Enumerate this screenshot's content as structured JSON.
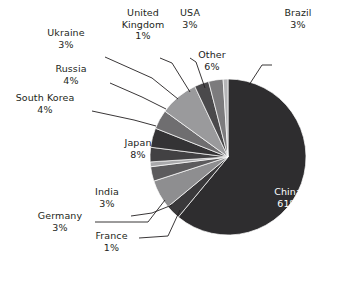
{
  "chart_data": {
    "type": "pie",
    "title": "",
    "subtitle": "",
    "xlabel": "",
    "ylabel": "",
    "legend_position": "none",
    "grid": false,
    "value_unit": "percent",
    "categories": [
      "China",
      "Brazil",
      "Other",
      "USA",
      "United Kingdom",
      "Ukraine",
      "Russia",
      "South Korea",
      "Japan",
      "India",
      "Germany",
      "France"
    ],
    "values": [
      61,
      3,
      6,
      3,
      1,
      3,
      4,
      4,
      8,
      3,
      3,
      1
    ],
    "labels": [
      "61%",
      "3%",
      "6%",
      "3%",
      "1%",
      "3%",
      "4%",
      "4%",
      "8%",
      "3%",
      "3%",
      "1%"
    ],
    "colors": [
      "#2e2d2f",
      "#3a393b",
      "#8e8e90",
      "#5c5b5d",
      "#a9a9ab",
      "#424143",
      "#343335",
      "#6f6e70",
      "#9a9a9c",
      "#4a494b",
      "#7c7b7d",
      "#b5b5b7"
    ],
    "slices": [
      {
        "name": "China",
        "percent": 61,
        "label": "China",
        "value_label": "61%",
        "color": "#2e2d2f",
        "label_placement": "inside",
        "text_color": "#ffffff"
      },
      {
        "name": "Brazil",
        "percent": 3,
        "label": "Brazil",
        "value_label": "3%",
        "color": "#3a393b",
        "label_placement": "outside",
        "text_color": "#231f20"
      },
      {
        "name": "Other",
        "percent": 6,
        "label": "Other",
        "value_label": "6%",
        "color": "#8e8e90",
        "label_placement": "inside",
        "text_color": "#1a1a1a"
      },
      {
        "name": "USA",
        "percent": 3,
        "label": "USA",
        "value_label": "3%",
        "color": "#5c5b5d",
        "label_placement": "outside",
        "text_color": "#231f20"
      },
      {
        "name": "United Kingdom",
        "percent": 1,
        "label": "United Kingdom",
        "value_label": "1%",
        "color": "#a9a9ab",
        "label_placement": "outside",
        "text_color": "#231f20"
      },
      {
        "name": "Ukraine",
        "percent": 3,
        "label": "Ukraine",
        "value_label": "3%",
        "color": "#424143",
        "label_placement": "outside",
        "text_color": "#231f20"
      },
      {
        "name": "Russia",
        "percent": 4,
        "label": "Russia",
        "value_label": "4%",
        "color": "#343335",
        "label_placement": "outside",
        "text_color": "#231f20"
      },
      {
        "name": "South Korea",
        "percent": 4,
        "label": "South Korea",
        "value_label": "4%",
        "color": "#6f6e70",
        "label_placement": "outside",
        "text_color": "#231f20"
      },
      {
        "name": "Japan",
        "percent": 8,
        "label": "Japan",
        "value_label": "8%",
        "color": "#9a9a9c",
        "label_placement": "inside",
        "text_color": "#1a1a1a"
      },
      {
        "name": "India",
        "percent": 3,
        "label": "India",
        "value_label": "3%",
        "color": "#4a494b",
        "label_placement": "outside",
        "text_color": "#231f20"
      },
      {
        "name": "Germany",
        "percent": 3,
        "label": "Germany",
        "value_label": "3%",
        "color": "#7c7b7d",
        "label_placement": "outside",
        "text_color": "#231f20"
      },
      {
        "name": "France",
        "percent": 1,
        "label": "France",
        "value_label": "1%",
        "color": "#b5b5b7",
        "label_placement": "outside",
        "text_color": "#231f20"
      }
    ]
  },
  "labels": {
    "brazil": {
      "name": "Brazil",
      "pct": "3%"
    },
    "usa": {
      "name": "USA",
      "pct": "3%"
    },
    "uk": {
      "name": "United Kingdom",
      "pct": "1%"
    },
    "ukraine": {
      "name": "Ukraine",
      "pct": "3%"
    },
    "russia": {
      "name": "Russia",
      "pct": "4%"
    },
    "skorea": {
      "name": "South Korea",
      "pct": "4%"
    },
    "india": {
      "name": "India",
      "pct": "3%"
    },
    "germany": {
      "name": "Germany",
      "pct": "3%"
    },
    "france": {
      "name": "France",
      "pct": "1%"
    },
    "other": {
      "name": "Other",
      "pct": "6%"
    },
    "japan": {
      "name": "Japan",
      "pct": "8%"
    },
    "china": {
      "name": "China",
      "pct": "61%"
    }
  }
}
